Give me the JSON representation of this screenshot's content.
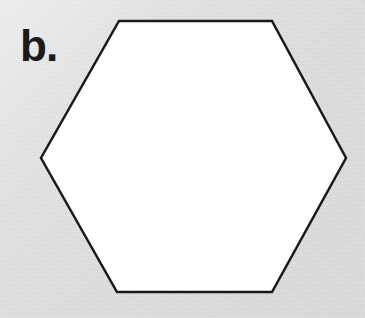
{
  "figure": {
    "label": "b.",
    "background_color": "#d9d9d9",
    "medium": "scanned-paper"
  },
  "shape": {
    "name": "hexagon",
    "sides": 6,
    "orientation": "flat-top",
    "fill_color": "#ffffff",
    "stroke_color": "#1a1a1a",
    "stroke_width": 2.5,
    "vertices": [
      {
        "x": 119,
        "y": 21
      },
      {
        "x": 272,
        "y": 21
      },
      {
        "x": 346,
        "y": 158
      },
      {
        "x": 272,
        "y": 292
      },
      {
        "x": 117,
        "y": 292
      },
      {
        "x": 41,
        "y": 158
      }
    ],
    "points_attr": "119,21 272,21 346,158 272,292 117,292 41,158"
  },
  "canvas": {
    "width": 365,
    "height": 318
  }
}
